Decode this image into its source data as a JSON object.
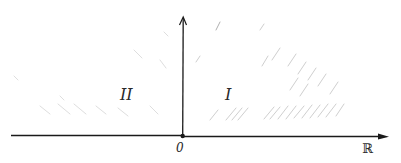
{
  "diagram": {
    "horizontal_axis": {
      "label": "ℝ",
      "origin_label": "0"
    },
    "vertical_axis": {
      "label": ""
    },
    "regions": [
      {
        "id": "region-2",
        "label": "II",
        "side": "left"
      },
      {
        "id": "region-1",
        "label": "I",
        "side": "right"
      }
    ],
    "colors": {
      "ink": "#1a1a1a",
      "hatch": "#c8c8c8",
      "background": "#ffffff"
    }
  }
}
